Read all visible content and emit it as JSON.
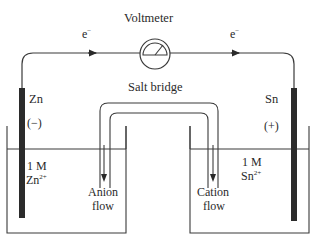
{
  "diagram": {
    "type": "galvanic-cell",
    "voltmeter": {
      "label": "Voltmeter"
    },
    "electron_flow": {
      "left_label": "e",
      "right_label": "e",
      "superscript": "−"
    },
    "salt_bridge": {
      "label": "Salt bridge"
    },
    "left_half_cell": {
      "electrode": "Zn",
      "polarity": "(−)",
      "concentration": "1 M",
      "ion": "Zn",
      "ion_charge": "2+",
      "flow_label_line1": "Anion",
      "flow_label_line2": "flow"
    },
    "right_half_cell": {
      "electrode": "Sn",
      "polarity": "(+)",
      "concentration": "1 M",
      "ion": "Sn",
      "ion_charge": "2+",
      "flow_label_line1": "Cation",
      "flow_label_line2": "flow"
    },
    "colors": {
      "line": "#3a3a3a",
      "electrode": "#2b2b2b",
      "text": "#2a2a2a",
      "background": "#ffffff"
    }
  }
}
